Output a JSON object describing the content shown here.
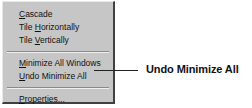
{
  "menu": {
    "groups": [
      [
        {
          "label": "Cascade",
          "mnemonic_index": 0
        },
        {
          "label": "Tile Horizontally",
          "mnemonic_index": 5
        },
        {
          "label": "Tile Vertically",
          "mnemonic_index": 5
        }
      ],
      [
        {
          "label": "Minimize All Windows",
          "mnemonic_index": 0
        },
        {
          "label": "Undo Minimize All",
          "mnemonic_index": 0
        }
      ],
      [
        {
          "label": "Properties...",
          "mnemonic_index": 0
        }
      ]
    ]
  },
  "callout": {
    "label": "Undo Minimize All",
    "target": "Undo Minimize All"
  }
}
